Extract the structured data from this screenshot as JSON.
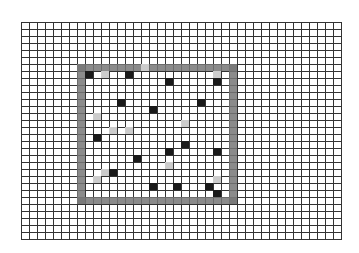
{
  "grid": {
    "cols": 40,
    "rows": 31,
    "cell_w": 8,
    "cell_h": 7,
    "origin": [
      21,
      22
    ],
    "line_color": "#333333"
  },
  "box": {
    "col_start": 7,
    "row_start": 6,
    "col_end": 26,
    "row_end": 25,
    "color": "#777777"
  },
  "colors": {
    "dark": "#1a1a1a",
    "light": "#cccccc"
  },
  "dark_cells": [
    [
      8,
      7
    ],
    [
      13,
      7
    ],
    [
      18,
      8
    ],
    [
      24,
      8
    ],
    [
      12,
      11
    ],
    [
      22,
      11
    ],
    [
      16,
      12
    ],
    [
      9,
      16
    ],
    [
      20,
      17
    ],
    [
      18,
      18
    ],
    [
      24,
      18
    ],
    [
      14,
      19
    ],
    [
      11,
      21
    ],
    [
      16,
      23
    ],
    [
      19,
      23
    ],
    [
      23,
      23
    ],
    [
      24,
      24
    ]
  ],
  "light_cells": [
    [
      10,
      7
    ],
    [
      15,
      6
    ],
    [
      24,
      7
    ],
    [
      9,
      13
    ],
    [
      11,
      15
    ],
    [
      13,
      15
    ],
    [
      20,
      14
    ],
    [
      18,
      20
    ],
    [
      9,
      22
    ],
    [
      10,
      21
    ],
    [
      24,
      22
    ]
  ]
}
